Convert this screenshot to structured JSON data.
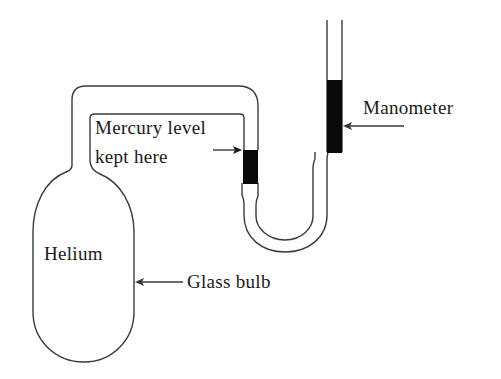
{
  "diagram": {
    "labels": {
      "manometer": "Manometer",
      "mercury_line1": "Mercury level",
      "mercury_line2": "kept here",
      "helium": "Helium",
      "glass_bulb": "Glass bulb"
    },
    "colors": {
      "stroke": "#3a3a3a",
      "mercury": "#0a0a0a",
      "background": "#ffffff"
    }
  }
}
